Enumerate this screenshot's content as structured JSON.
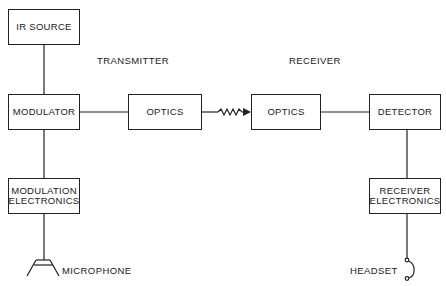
{
  "diagram": {
    "sections": {
      "transmitter": "TRANSMITTER",
      "receiver": "RECEIVER"
    },
    "blocks": {
      "ir_source": "IR SOURCE",
      "modulator": "MODULATOR",
      "modulation_electronics_line1": "MODULATION",
      "modulation_electronics_line2": "ELECTRONICS",
      "optics_tx": "OPTICS",
      "optics_rx": "OPTICS",
      "detector": "DETECTOR",
      "receiver_electronics_line1": "RECEIVER",
      "receiver_electronics_line2": "ELECTRONICS"
    },
    "transducers": {
      "microphone": "MICROPHONE",
      "headset": "HEADSET"
    },
    "connections": [
      {
        "from": "IR SOURCE",
        "to": "MODULATOR"
      },
      {
        "from": "MODULATOR",
        "to": "MODULATION ELECTRONICS"
      },
      {
        "from": "MODULATION ELECTRONICS",
        "to": "MICROPHONE"
      },
      {
        "from": "MODULATOR",
        "to": "OPTICS (TX)"
      },
      {
        "from": "OPTICS (TX)",
        "to": "OPTICS (RX)",
        "style": "wavy-arrow"
      },
      {
        "from": "OPTICS (RX)",
        "to": "DETECTOR"
      },
      {
        "from": "DETECTOR",
        "to": "RECEIVER ELECTRONICS"
      },
      {
        "from": "RECEIVER ELECTRONICS",
        "to": "HEADSET"
      }
    ]
  }
}
